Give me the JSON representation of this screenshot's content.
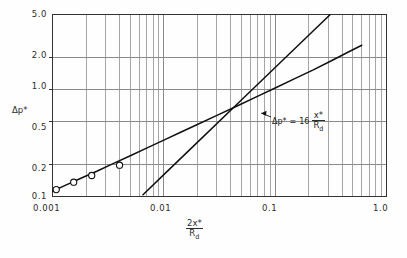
{
  "figure": {
    "background": "#fefefe",
    "frame_color": "#333333",
    "grid_color": "#8a8a8a",
    "curve_color": "#111111",
    "marker_color": "#111111"
  },
  "axes": {
    "x": {
      "label_numerator": "2x*",
      "label_denominator_base": "R",
      "label_denominator_sub": "d",
      "scale": "log",
      "min": 0.001,
      "max": 1.0,
      "decade_labels": [
        "0.001",
        "0.01",
        "0.1",
        "1.0"
      ],
      "decade_values": [
        0.001,
        0.01,
        0.1,
        1.0
      ]
    },
    "y": {
      "label": "Δp*",
      "scale": "log",
      "min": 0.1,
      "max": 5.0,
      "tick_labels": [
        "5.0",
        "2.0",
        "1.0",
        "0.5",
        "0.2",
        "0.1"
      ],
      "tick_values": [
        5.0,
        2.0,
        1.0,
        0.5,
        0.2,
        0.1
      ]
    }
  },
  "annotation": {
    "lhs": "Δp*",
    "equals": "=",
    "coefficient": "16",
    "numerator": "x*",
    "denominator_base": "R",
    "denominator_sub": "d"
  },
  "chart_data": {
    "type": "line",
    "title": "",
    "xlabel": "2x*/R_d",
    "ylabel": "Δp*",
    "xscale": "log",
    "yscale": "log",
    "xlim": [
      0.001,
      1.0
    ],
    "ylim": [
      0.1,
      5.0
    ],
    "grid": true,
    "legend": "none",
    "annotations": [
      {
        "text": "Δp* = 16 x*/R_d",
        "x": 0.12,
        "y": 0.62,
        "points_to_x": 0.075,
        "points_to_y": 0.6
      }
    ],
    "series": [
      {
        "name": "upper-curve",
        "type": "line",
        "style": "solid",
        "x": [
          0.001,
          0.0013,
          0.0018,
          0.0025,
          0.0035,
          0.005,
          0.007,
          0.01,
          0.014,
          0.02,
          0.03,
          0.045,
          0.07,
          0.1,
          0.15,
          0.22,
          0.32,
          0.45,
          0.6
        ],
        "y": [
          0.112,
          0.127,
          0.148,
          0.172,
          0.203,
          0.24,
          0.283,
          0.336,
          0.396,
          0.47,
          0.572,
          0.695,
          0.865,
          1.03,
          1.26,
          1.52,
          1.85,
          2.22,
          2.58
        ]
      },
      {
        "name": "linear-asymptote",
        "type": "line",
        "style": "solid",
        "x": [
          0.0065,
          0.01,
          0.02,
          0.05,
          0.1,
          0.2,
          0.35,
          0.5
        ],
        "y": [
          0.104,
          0.16,
          0.32,
          0.8,
          1.6,
          3.2,
          5.6,
          8.0
        ]
      }
    ],
    "markers": [
      {
        "name": "data-point-1",
        "x": 0.00108,
        "y": 0.116,
        "symbol": "open-circle"
      },
      {
        "name": "data-point-2",
        "x": 0.00155,
        "y": 0.136,
        "symbol": "open-circle"
      },
      {
        "name": "data-point-3",
        "x": 0.00225,
        "y": 0.157,
        "symbol": "open-circle"
      },
      {
        "name": "data-point-4",
        "x": 0.004,
        "y": 0.196,
        "symbol": "open-circle"
      }
    ]
  }
}
